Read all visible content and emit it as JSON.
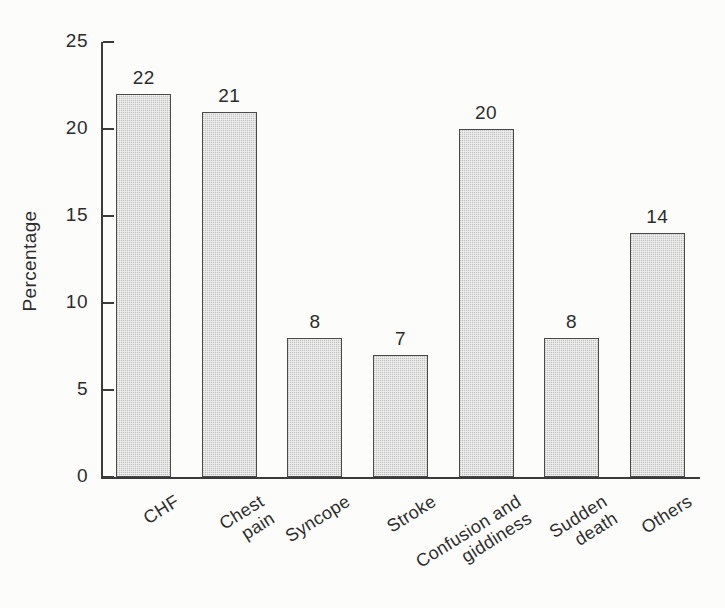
{
  "chart_data": {
    "type": "bar",
    "title": "",
    "subtitle": "",
    "xlabel": "",
    "ylabel": "Percentage",
    "categories": [
      "CHF",
      "Chest\npain",
      "Syncope",
      "Stroke",
      "Confusion and\ngiddiness",
      "Sudden\ndeath",
      "Others"
    ],
    "values": [
      22,
      21,
      8,
      7,
      20,
      8,
      14
    ],
    "value_labels": [
      "22",
      "21",
      "8",
      "7",
      "20",
      "8",
      "14"
    ],
    "ylim": [
      0,
      25
    ],
    "yticks": [
      0,
      5,
      10,
      15,
      20,
      25
    ],
    "ytick_labels": [
      "0",
      "5",
      "10",
      "15",
      "20",
      "25"
    ],
    "grid": false,
    "legend": false,
    "legend_position": "none",
    "bar_fill_color": "#e2e2e2",
    "bar_edge_color": "#4a4a4a",
    "axis_color": "#3b3b3b",
    "text_color": "#2c2c2c",
    "background_color": "#fcfcfa",
    "label_rotation_degrees": -32
  }
}
